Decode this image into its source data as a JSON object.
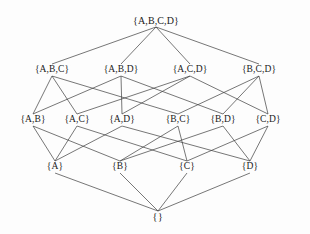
{
  "diagram": {
    "background_color": "#fdfdfd",
    "line_color": "#3c3c3c",
    "text_color": "#1a1a1a"
  },
  "chart_data": {
    "type": "diagram",
    "title": "",
    "xlabel": "",
    "ylabel": "",
    "grid": false,
    "legend": false,
    "nodes": [
      {
        "id": "ABCD",
        "label": "{A,B,C,D}",
        "level": 0,
        "x": 156,
        "y": 21
      },
      {
        "id": "ABC",
        "label": "{A,B,C}",
        "level": 1,
        "x": 52,
        "y": 70
      },
      {
        "id": "ABD",
        "label": "{A,B,D}",
        "level": 1,
        "x": 121,
        "y": 70
      },
      {
        "id": "ACD",
        "label": "{A,C,D}",
        "level": 1,
        "x": 190,
        "y": 70
      },
      {
        "id": "BCD",
        "label": "{B,C,D}",
        "level": 1,
        "x": 259,
        "y": 70
      },
      {
        "id": "AB",
        "label": "{A,B}",
        "level": 2,
        "x": 33,
        "y": 120
      },
      {
        "id": "AC",
        "label": "{A,C}",
        "level": 2,
        "x": 77,
        "y": 120
      },
      {
        "id": "AD",
        "label": "{A,D}",
        "level": 2,
        "x": 122,
        "y": 120
      },
      {
        "id": "BC",
        "label": "{B,C}",
        "level": 2,
        "x": 178,
        "y": 120
      },
      {
        "id": "BD",
        "label": "{B,D}",
        "level": 2,
        "x": 223,
        "y": 120
      },
      {
        "id": "CD",
        "label": "{C,D}",
        "level": 2,
        "x": 268,
        "y": 120
      },
      {
        "id": "A",
        "label": "{A}",
        "level": 3,
        "x": 55,
        "y": 167
      },
      {
        "id": "B",
        "label": "{B}",
        "level": 3,
        "x": 120,
        "y": 167
      },
      {
        "id": "C",
        "label": "{C}",
        "level": 3,
        "x": 187,
        "y": 167
      },
      {
        "id": "D",
        "label": "{D}",
        "level": 3,
        "x": 250,
        "y": 167
      },
      {
        "id": "EMPTY",
        "label": "{}",
        "level": 4,
        "x": 158,
        "y": 217
      }
    ],
    "edges": [
      {
        "from": "ABCD",
        "to": "ABC"
      },
      {
        "from": "ABCD",
        "to": "ABD"
      },
      {
        "from": "ABCD",
        "to": "ACD"
      },
      {
        "from": "ABCD",
        "to": "BCD"
      },
      {
        "from": "ABC",
        "to": "AB"
      },
      {
        "from": "ABC",
        "to": "AC"
      },
      {
        "from": "ABC",
        "to": "BC"
      },
      {
        "from": "ABD",
        "to": "AB"
      },
      {
        "from": "ABD",
        "to": "AD"
      },
      {
        "from": "ABD",
        "to": "BD"
      },
      {
        "from": "ACD",
        "to": "AC"
      },
      {
        "from": "ACD",
        "to": "AD"
      },
      {
        "from": "ACD",
        "to": "CD"
      },
      {
        "from": "BCD",
        "to": "BC"
      },
      {
        "from": "BCD",
        "to": "BD"
      },
      {
        "from": "BCD",
        "to": "CD"
      },
      {
        "from": "AB",
        "to": "A"
      },
      {
        "from": "AB",
        "to": "B"
      },
      {
        "from": "AC",
        "to": "A"
      },
      {
        "from": "AC",
        "to": "C"
      },
      {
        "from": "AD",
        "to": "A"
      },
      {
        "from": "AD",
        "to": "D"
      },
      {
        "from": "BC",
        "to": "B"
      },
      {
        "from": "BC",
        "to": "C"
      },
      {
        "from": "BD",
        "to": "B"
      },
      {
        "from": "BD",
        "to": "D"
      },
      {
        "from": "CD",
        "to": "C"
      },
      {
        "from": "CD",
        "to": "D"
      },
      {
        "from": "A",
        "to": "EMPTY"
      },
      {
        "from": "B",
        "to": "EMPTY"
      },
      {
        "from": "C",
        "to": "EMPTY"
      },
      {
        "from": "D",
        "to": "EMPTY"
      }
    ],
    "level_label_half_height": 6
  }
}
